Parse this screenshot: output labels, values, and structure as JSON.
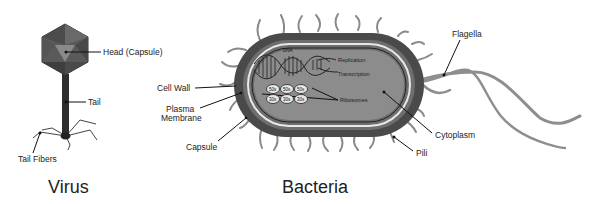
{
  "virus": {
    "title": "Virus",
    "labels": {
      "head": "Head (Capsule)",
      "tail": "Tail",
      "tail_fibers": "Tail Fibers"
    }
  },
  "bacteria": {
    "title": "Bacteria",
    "labels": {
      "cell_wall": "Cell Wall",
      "plasma_membrane_1": "Plasma",
      "plasma_membrane_2": "Membrane",
      "capsule": "Capsule",
      "flagella": "Flagella",
      "cytoplasm": "Cytoplasm",
      "pili": "Pili",
      "dna": "DNA",
      "replication": "Replication",
      "transcription": "Transcription",
      "ribosomes": "Ribosomes"
    },
    "ribosome_units": {
      "top": [
        "50s",
        "50s",
        "50s"
      ],
      "bottom": [
        "30s",
        "30s",
        "30s"
      ]
    }
  },
  "colors": {
    "capsule": "#4a4a4a",
    "cell_wall": "#6e6e6e",
    "membrane": "#e8e8e8",
    "cytoplasm": "#8c8c8c",
    "pili": "#8a8a8a",
    "virus_head": "#5a5a5a",
    "virus_tail": "#2e2e2e"
  }
}
